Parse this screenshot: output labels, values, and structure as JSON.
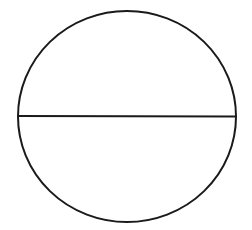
{
  "diagram": {
    "type": "circle-with-diameter",
    "background": "#ffffff",
    "stroke_color": "#1a1a1a",
    "stroke_width": 2,
    "circle": {
      "cx": 127,
      "cy": 116.5,
      "rx": 109,
      "ry": 105.5
    },
    "diameter": {
      "x1": 18,
      "y1": 116,
      "x2": 236,
      "y2": 116.5
    }
  }
}
